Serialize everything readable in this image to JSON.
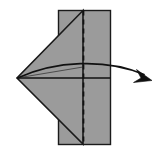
{
  "figure": {
    "background_color": "#ffffff"
  },
  "colors": {
    "paper_fill": "#9b9b9b",
    "paper_stroke": "#1a1a1a",
    "fold_line": "#111111",
    "dashed_line": "#111111",
    "arrow": "#111111"
  },
  "shapes": {
    "rectangle": {
      "name": "paper-sheet",
      "x": 58.5,
      "y": 10.5,
      "width": 52,
      "height": 134,
      "stroke_width": 1.4
    },
    "triangle": {
      "name": "folded-flap",
      "points": "83,10.5 17,78 83,144",
      "stroke_width": 1.6
    },
    "crease_horizontal": {
      "name": "horizontal-crease",
      "x1": 17,
      "y1": 78,
      "x2": 110.5,
      "y2": 78,
      "stroke_width": 1.3
    },
    "crease_upper": {
      "name": "upper-crease",
      "x1": 17,
      "y1": 78,
      "x2": 83,
      "y2": 67,
      "stroke_width": 1.1
    },
    "dashed_fold_line": {
      "name": "fold-line-dashed",
      "x1": 83.5,
      "y1": 10.5,
      "x2": 83.5,
      "y2": 144,
      "stroke_width": 1.7,
      "dash_pattern": "5 4"
    },
    "arrow": {
      "name": "fold-direction-arrow",
      "path": "M 17.5 78 C 55 61 105 58 146 75",
      "stroke_width": 1.7,
      "head_points": "151,79.5 138,70.5 141.5,78.5 135,83",
      "tip_x": 151,
      "tip_y": 79.5
    }
  },
  "labels": {
    "step_number": "",
    "caption": ""
  }
}
